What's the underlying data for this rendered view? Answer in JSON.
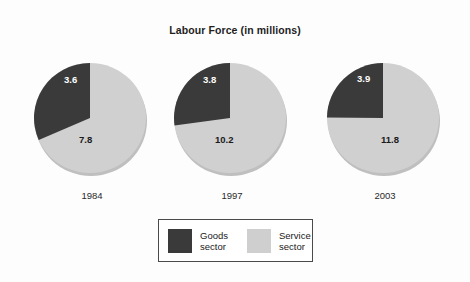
{
  "chart_data": {
    "type": "pie",
    "title": "Labour Force (in millions)",
    "xlabel": "",
    "ylabel": "",
    "legend_position": "bottom-center",
    "grid": false,
    "colors": {
      "goods_sector": "#3a3a3a",
      "service_sector": "#cfcfcf",
      "background": "#fdfdfd",
      "legend_border": "#4a4a4a"
    },
    "legend": [
      {
        "label_line1": "Goods",
        "label_line2": "sector",
        "color": "#3a3a3a",
        "key": "goods-sector"
      },
      {
        "label_line1": "Service",
        "label_line2": "sector",
        "color": "#cfcfcf",
        "key": "service-sector"
      }
    ],
    "categories": [
      "Goods sector",
      "Service sector"
    ],
    "pies": [
      {
        "year": "1984",
        "total": 11.4,
        "slices": [
          {
            "name": "Goods sector",
            "value": 3.6,
            "label": "3.6",
            "percent": 31.6
          },
          {
            "name": "Service sector",
            "value": 7.8,
            "label": "7.8",
            "percent": 68.4
          }
        ]
      },
      {
        "year": "1997",
        "total": 14.0,
        "slices": [
          {
            "name": "Goods sector",
            "value": 3.8,
            "label": "3.8",
            "percent": 27.1
          },
          {
            "name": "Service sector",
            "value": 10.2,
            "label": "10.2",
            "percent": 72.9
          }
        ]
      },
      {
        "year": "2003",
        "total": 15.7,
        "slices": [
          {
            "name": "Goods sector",
            "value": 3.9,
            "label": "3.9",
            "percent": 24.8
          },
          {
            "name": "Service sector",
            "value": 11.8,
            "label": "11.8",
            "percent": 75.2
          }
        ]
      }
    ]
  }
}
